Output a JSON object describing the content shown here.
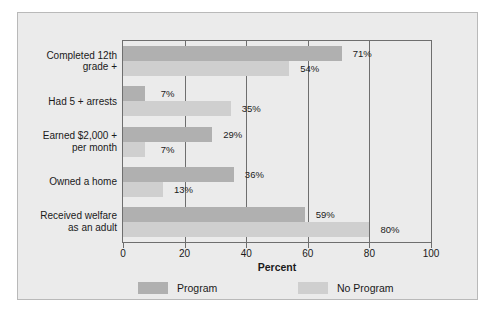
{
  "chart_data": {
    "type": "bar",
    "orientation": "horizontal",
    "title": "",
    "xlabel": "Percent",
    "ylabel": "",
    "xlim": [
      0,
      100
    ],
    "xticks": [
      0,
      20,
      40,
      60,
      80,
      100
    ],
    "grid": true,
    "legend_position": "bottom",
    "categories": [
      "Completed 12th grade +",
      "Had 5 + arrests",
      "Earned $2,000 + per month",
      "Owned a home",
      "Received welfare as an adult"
    ],
    "category_lines": [
      [
        "Completed 12th",
        "grade +"
      ],
      [
        "Had 5 + arrests"
      ],
      [
        "Earned $2,000 +",
        "per month"
      ],
      [
        "Owned a home"
      ],
      [
        "Received welfare",
        "as an adult"
      ]
    ],
    "series": [
      {
        "name": "Program",
        "color": "#b0b0b0",
        "values": [
          71,
          7,
          29,
          36,
          59
        ],
        "labels": [
          "71%",
          "7%",
          "29%",
          "36%",
          "59%"
        ]
      },
      {
        "name": "No Program",
        "color": "#cfcfcf",
        "values": [
          54,
          35,
          7,
          13,
          80
        ],
        "labels": [
          "54%",
          "35%",
          "7%",
          "13%",
          "80%"
        ]
      }
    ]
  },
  "axis": {
    "title": "Percent",
    "tick_labels": [
      "0",
      "20",
      "40",
      "60",
      "80",
      "100"
    ]
  },
  "legend": {
    "items": [
      {
        "label": "Program",
        "color": "#b0b0b0"
      },
      {
        "label": "No Program",
        "color": "#cfcfcf"
      }
    ]
  },
  "colors": {
    "figure_background": "#ebebeb",
    "figure_border": "#b9b9b9",
    "axis_line": "#6e6e6e",
    "program": "#b0b0b0",
    "no_program": "#cfcfcf",
    "text": "#1a1a1a"
  }
}
